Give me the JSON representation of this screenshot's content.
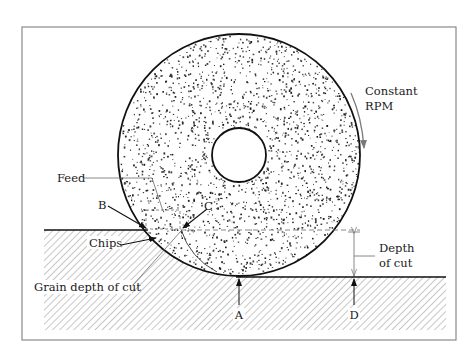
{
  "figure": {
    "type": "grinding-process-schematic",
    "frame_color": "#8a8a8a",
    "ink_color": "#111111",
    "gray_ink": "#7a7a7a"
  },
  "wheel": {
    "center_x": 239,
    "center_y": 155,
    "radius": 121,
    "hub_radius": 27,
    "stipple_seed": 7,
    "stipple_count": 2600
  },
  "labels": {
    "constant": "Constant",
    "rpm": "RPM",
    "feed": "Feed",
    "point_b": "B",
    "point_c": "C",
    "chips": "Chips",
    "grain_depth": "Grain depth of cut",
    "depth": "Depth",
    "of_cut": "of cut",
    "point_a": "A",
    "point_d": "D"
  }
}
